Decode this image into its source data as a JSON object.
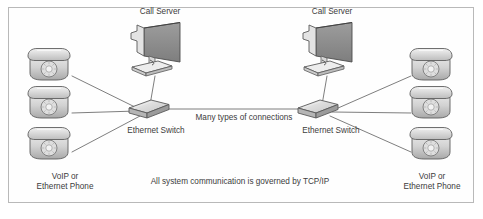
{
  "diagram": {
    "title_caption": "All system communication is governed by TCP/IP",
    "wan_link_label": "Many types of connections",
    "colors": {
      "frame_border": "#b9b9b9",
      "background": "#fefefe",
      "line": "#6f6f6f",
      "text": "#3c3c3c",
      "device_fill_light": "#e6e6e6",
      "device_fill_mid": "#c9c9c9",
      "device_fill_dark": "#8f8f8f",
      "device_stroke": "#5a5a5a"
    },
    "sites": [
      {
        "id": "left-site",
        "call_server_label": "Call Server",
        "switch_label": "Ethernet Switch",
        "phones": [
          {
            "id": "left-phone-top",
            "label_line1": "",
            "label_line2": ""
          },
          {
            "id": "left-phone-middle",
            "label_line1": "",
            "label_line2": ""
          },
          {
            "id": "left-phone-bottom",
            "label_line1": "VoIP or",
            "label_line2": "Ethernet Phone"
          }
        ]
      },
      {
        "id": "right-site",
        "call_server_label": "Call Server",
        "switch_label": "Ethernet Switch",
        "phones": [
          {
            "id": "right-phone-top",
            "label_line1": "",
            "label_line2": ""
          },
          {
            "id": "right-phone-middle",
            "label_line1": "",
            "label_line2": ""
          },
          {
            "id": "right-phone-bottom",
            "label_line1": "VoIP or",
            "label_line2": "Ethernet Phone"
          }
        ]
      }
    ]
  }
}
